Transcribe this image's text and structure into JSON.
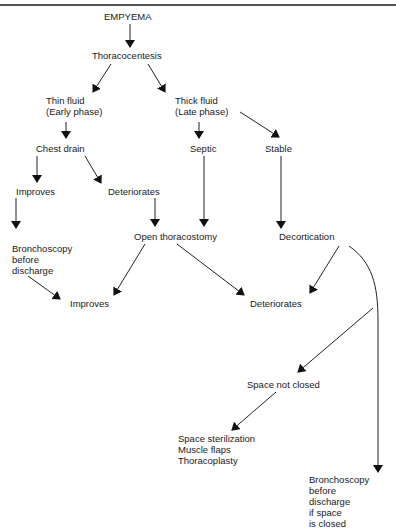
{
  "diagram": {
    "type": "flowchart",
    "title": "EMPYEMA",
    "nodes": {
      "empyema": {
        "lines": [
          "EMPYEMA"
        ]
      },
      "thoracocentesis": {
        "lines": [
          "Thoracocentesis"
        ]
      },
      "thin_fluid": {
        "lines": [
          "Thin fluid",
          "(Early phase)"
        ]
      },
      "thick_fluid": {
        "lines": [
          "Thick fluid",
          "(Late phase)"
        ]
      },
      "chest_drain": {
        "lines": [
          "Chest drain"
        ]
      },
      "septic": {
        "lines": [
          "Septic"
        ]
      },
      "stable": {
        "lines": [
          "Stable"
        ]
      },
      "improves_1": {
        "lines": [
          "Improves"
        ]
      },
      "deteriorates_1": {
        "lines": [
          "Deteriorates"
        ]
      },
      "bronchoscopy_1": {
        "lines": [
          "Bronchoscopy",
          "before",
          "discharge"
        ]
      },
      "open_thoracostomy": {
        "lines": [
          "Open thoracostomy"
        ]
      },
      "decortication": {
        "lines": [
          "Decortication"
        ]
      },
      "improves_2": {
        "lines": [
          "Improves"
        ]
      },
      "deteriorates_2": {
        "lines": [
          "Deteriorates"
        ]
      },
      "space_not_closed": {
        "lines": [
          "Space not closed"
        ]
      },
      "space_options": {
        "lines": [
          "Space sterilization",
          "Muscle flaps",
          "Thoracoplasty"
        ]
      },
      "bronchoscopy_2": {
        "lines": [
          "Bronchoscopy",
          "before",
          "discharge",
          "if space",
          "is closed"
        ]
      }
    },
    "edges": [
      {
        "from": "empyema",
        "to": "thoracocentesis"
      },
      {
        "from": "thoracocentesis",
        "to": "thin_fluid"
      },
      {
        "from": "thoracocentesis",
        "to": "thick_fluid"
      },
      {
        "from": "thin_fluid",
        "to": "chest_drain"
      },
      {
        "from": "thick_fluid",
        "to": "septic"
      },
      {
        "from": "thick_fluid",
        "to": "stable"
      },
      {
        "from": "chest_drain",
        "to": "improves_1"
      },
      {
        "from": "chest_drain",
        "to": "deteriorates_1"
      },
      {
        "from": "improves_1",
        "to": "bronchoscopy_1"
      },
      {
        "from": "deteriorates_1",
        "to": "open_thoracostomy"
      },
      {
        "from": "septic",
        "to": "open_thoracostomy"
      },
      {
        "from": "stable",
        "to": "decortication"
      },
      {
        "from": "bronchoscopy_1",
        "to": "improves_2"
      },
      {
        "from": "open_thoracostomy",
        "to": "improves_2"
      },
      {
        "from": "open_thoracostomy",
        "to": "deteriorates_2"
      },
      {
        "from": "decortication",
        "to": "deteriorates_2"
      },
      {
        "from": "decortication",
        "to": "bronchoscopy_2"
      },
      {
        "from": "decortication",
        "to": "space_not_closed"
      },
      {
        "from": "space_not_closed",
        "to": "space_options"
      }
    ]
  }
}
